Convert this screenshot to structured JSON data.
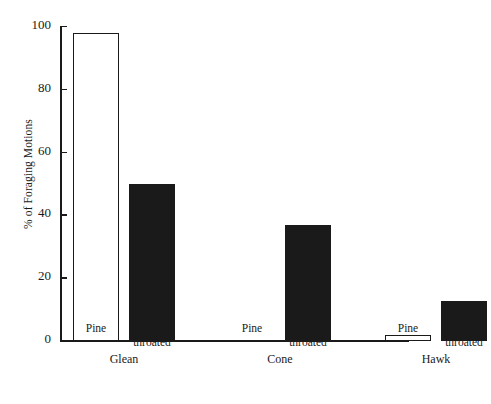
{
  "chart_data": {
    "type": "bar",
    "title": "",
    "xlabel": "",
    "ylabel": "% of Foraging Motions",
    "ylim": [
      0,
      100
    ],
    "yticks": [
      0,
      20,
      40,
      60,
      80,
      100
    ],
    "ytick_labels": [
      "0",
      "20",
      "40",
      "60",
      "80",
      "100"
    ],
    "grid": false,
    "legend": "none",
    "groups": [
      {
        "name": "Glean",
        "bars": [
          {
            "category": "Pine",
            "category_line1": "Pine",
            "category_line2": "",
            "value": 98,
            "style": "open"
          },
          {
            "category": "Yellow–throated",
            "category_line1": "Yellow–",
            "category_line2": "throated",
            "value": 50,
            "style": "filled"
          }
        ]
      },
      {
        "name": "Cone",
        "bars": [
          {
            "category": "Pine",
            "category_line1": "Pine",
            "category_line2": "",
            "value": 0,
            "style": "open"
          },
          {
            "category": "Yellow–throated",
            "category_line1": "Yellow–",
            "category_line2": "throated",
            "value": 37,
            "style": "filled"
          }
        ]
      },
      {
        "name": "Hawk",
        "bars": [
          {
            "category": "Pine",
            "category_line1": "Pine",
            "category_line2": "",
            "value": 2,
            "style": "open"
          },
          {
            "category": "Yellow–throated",
            "category_line1": "Yellow–",
            "category_line2": "throated",
            "value": 12.7,
            "style": "filled"
          }
        ]
      }
    ],
    "series": [
      {
        "name": "Pine",
        "values": [
          98,
          0,
          2
        ]
      },
      {
        "name": "Yellow–throated",
        "values": [
          50,
          37,
          12.7
        ]
      }
    ],
    "categories": [
      "Glean",
      "Cone",
      "Hawk"
    ],
    "colors": {
      "open_bar_fill": "#ffffff",
      "open_bar_stroke": "#1a1a1a",
      "filled_bar": "#1a1a1a",
      "axis": "#1a1a1a",
      "background": "#ffffff"
    }
  }
}
